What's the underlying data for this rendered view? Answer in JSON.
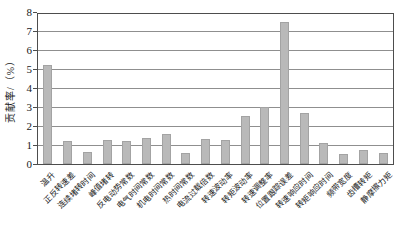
{
  "chart_data": {
    "type": "bar",
    "title": "",
    "xlabel": "",
    "ylabel": "贡献率/（%）",
    "ylim": [
      0,
      8
    ],
    "yticks": [
      0,
      1,
      2,
      3,
      4,
      5,
      6,
      7,
      8
    ],
    "grid": true,
    "legend_position": "none",
    "bar_color": "#b9b9b9",
    "gridline_color": "#8f8f8f",
    "axis_color": "#4d4d4d",
    "categories": [
      "温升",
      "正反转速差",
      "连续堵转时间",
      "峰值堵转",
      "反电动势常数",
      "电气时间常数",
      "机电时间常数",
      "热时间常数",
      "电流过载倍数",
      "转速波动率",
      "转矩波动率",
      "转速调整率",
      "位置跟踪误差",
      "转速响应时间",
      "转矩响应时间",
      "频带宽度",
      "齿槽转矩",
      "静摩擦力矩"
    ],
    "values": [
      5.2,
      1.2,
      0.65,
      1.25,
      1.2,
      1.35,
      1.6,
      0.6,
      1.3,
      1.25,
      2.55,
      3.0,
      7.5,
      2.7,
      1.1,
      0.55,
      0.75,
      0.6
    ]
  }
}
